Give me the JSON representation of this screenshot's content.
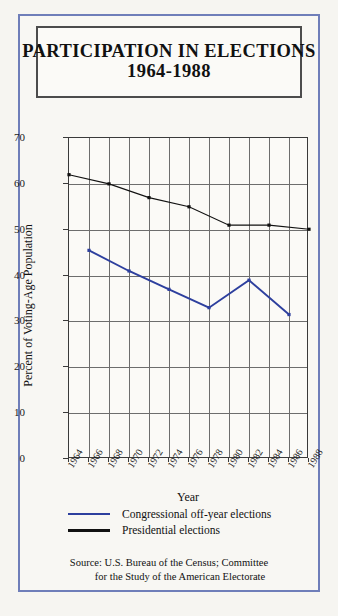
{
  "title": {
    "line1": "PARTICIPATION IN ELECTIONS",
    "line2": "1964-1988"
  },
  "axes": {
    "xlabel": "Year",
    "ylabel": "Percent of Voting-Age Population"
  },
  "legend": {
    "items": [
      {
        "label": "Congressional off-year elections",
        "color": "#2d3f9e"
      },
      {
        "label": "Presidential elections",
        "color": "#111111"
      }
    ]
  },
  "source": {
    "line1": "Source: U.S. Bureau of the Census; Committee",
    "line2": "for the Study of the American Electorate"
  },
  "colors": {
    "frame": "#6f7eb9",
    "title_border": "#4c4c4c",
    "grid": "#6d6d6d",
    "congressional": "#2d3f9e",
    "presidential": "#111111",
    "background": "#f8f7f3"
  },
  "chart_data": {
    "type": "line",
    "title": "PARTICIPATION IN ELECTIONS 1964-1988",
    "xlabel": "Year",
    "ylabel": "Percent of Voting-Age Population",
    "xlim": [
      1964,
      1988
    ],
    "ylim": [
      0,
      70
    ],
    "ytick_labels": [
      "0",
      "10",
      "20",
      "30",
      "40",
      "50",
      "60",
      "70"
    ],
    "yticks": [
      0,
      10,
      20,
      30,
      40,
      50,
      60,
      70
    ],
    "xtick_labels": [
      "1964",
      "1966",
      "1968",
      "1970",
      "1972",
      "1974",
      "1976",
      "1978",
      "1980",
      "1982",
      "1984",
      "1986",
      "1988"
    ],
    "xticks": [
      1964,
      1966,
      1968,
      1970,
      1972,
      1974,
      1976,
      1978,
      1980,
      1982,
      1984,
      1986,
      1988
    ],
    "grid": true,
    "legend_position": "below",
    "series": [
      {
        "name": "Presidential elections",
        "color": "#111111",
        "x": [
          1964,
          1968,
          1972,
          1976,
          1980,
          1984,
          1988
        ],
        "values": [
          62,
          60,
          57,
          55,
          51,
          51,
          50.1
        ]
      },
      {
        "name": "Congressional off-year elections",
        "color": "#2d3f9e",
        "x": [
          1966,
          1970,
          1974,
          1978,
          1982,
          1986
        ],
        "values": [
          45.5,
          41,
          37,
          33,
          39,
          31.5
        ]
      }
    ]
  }
}
